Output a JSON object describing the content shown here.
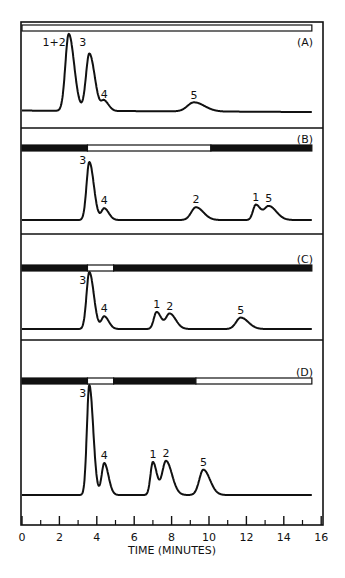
{
  "chart_data": {
    "type": "line",
    "title": "",
    "xlabel": "TIME (MINUTES)",
    "ylabel": "",
    "xlim": [
      0,
      16
    ],
    "x_ticks_major": [
      0,
      2,
      4,
      6,
      8,
      10,
      12,
      14,
      16
    ],
    "x_ticks_minor": [
      1,
      3,
      5,
      7,
      9,
      11,
      13,
      15
    ],
    "grid": false,
    "legend": null,
    "panels": [
      {
        "label": "(A)",
        "program_bar": [
          {
            "start": 0,
            "end": 15.5,
            "state": "white"
          }
        ],
        "baseline": 0.05,
        "peaks": [
          {
            "label": "1+2",
            "time": 2.5,
            "height": 1.1,
            "width": 0.18
          },
          {
            "label": "3",
            "time": 3.6,
            "height": 0.82,
            "width": 0.18
          },
          {
            "label": "4",
            "time": 4.4,
            "height": 0.14,
            "width": 0.15
          },
          {
            "label": "5",
            "time": 9.2,
            "height": 0.13,
            "width": 0.35
          }
        ]
      },
      {
        "label": "(B)",
        "program_bar": [
          {
            "start": 0,
            "end": 3.5,
            "state": "black"
          },
          {
            "start": 3.5,
            "end": 10.1,
            "state": "white"
          },
          {
            "start": 10.1,
            "end": 15.5,
            "state": "black"
          }
        ],
        "baseline": 0.0,
        "peaks": [
          {
            "label": "3",
            "time": 3.6,
            "height": 1.0,
            "width": 0.15
          },
          {
            "label": "4",
            "time": 4.4,
            "height": 0.2,
            "width": 0.15
          },
          {
            "label": "2",
            "time": 9.3,
            "height": 0.22,
            "width": 0.25
          },
          {
            "label": "1",
            "time": 12.5,
            "height": 0.26,
            "width": 0.15
          },
          {
            "label": "5",
            "time": 13.2,
            "height": 0.24,
            "width": 0.25
          }
        ]
      },
      {
        "label": "(C)",
        "program_bar": [
          {
            "start": 0,
            "end": 3.5,
            "state": "black"
          },
          {
            "start": 3.5,
            "end": 4.9,
            "state": "white"
          },
          {
            "start": 4.9,
            "end": 15.5,
            "state": "black"
          }
        ],
        "baseline": 0.0,
        "peaks": [
          {
            "label": "3",
            "time": 3.6,
            "height": 1.0,
            "width": 0.15
          },
          {
            "label": "4",
            "time": 4.4,
            "height": 0.22,
            "width": 0.15
          },
          {
            "label": "1",
            "time": 7.2,
            "height": 0.3,
            "width": 0.15
          },
          {
            "label": "2",
            "time": 7.9,
            "height": 0.27,
            "width": 0.2
          },
          {
            "label": "5",
            "time": 11.7,
            "height": 0.2,
            "width": 0.25
          }
        ]
      },
      {
        "label": "(D)",
        "program_bar": [
          {
            "start": 0,
            "end": 3.5,
            "state": "black"
          },
          {
            "start": 3.5,
            "end": 4.9,
            "state": "white"
          },
          {
            "start": 4.9,
            "end": 9.3,
            "state": "black"
          },
          {
            "start": 9.3,
            "end": 15.5,
            "state": "white"
          }
        ],
        "baseline": 0.0,
        "peaks": [
          {
            "label": "3",
            "time": 3.6,
            "height": 1.0,
            "width": 0.13
          },
          {
            "label": "4",
            "time": 4.4,
            "height": 0.29,
            "width": 0.14
          },
          {
            "label": "1",
            "time": 7.0,
            "height": 0.3,
            "width": 0.13
          },
          {
            "label": "2",
            "time": 7.7,
            "height": 0.31,
            "width": 0.2
          },
          {
            "label": "5",
            "time": 9.7,
            "height": 0.23,
            "width": 0.22
          }
        ]
      }
    ]
  },
  "layout": {
    "x0_px": 22,
    "px_per_min": 18.7,
    "frame": {
      "left": 21,
      "top": 22,
      "right": 323,
      "bottom": 525
    },
    "panels_px": [
      {
        "top": 22,
        "bottom": 128,
        "bar_y": 28,
        "base_y": 112,
        "scale_y": 70,
        "label_y": 46
      },
      {
        "top": 128,
        "bottom": 234,
        "bar_y": 148,
        "base_y": 220,
        "scale_y": 58,
        "label_y": 143
      },
      {
        "top": 234,
        "bottom": 340,
        "bar_y": 268,
        "base_y": 329,
        "scale_y": 57,
        "label_y": 263
      },
      {
        "top": 340,
        "bottom": 525,
        "bar_y": 381,
        "base_y": 495,
        "scale_y": 110,
        "label_y": 376
      }
    ],
    "axis_y": 525
  },
  "colors": {
    "ink": "#111111",
    "paper": "#ffffff"
  }
}
